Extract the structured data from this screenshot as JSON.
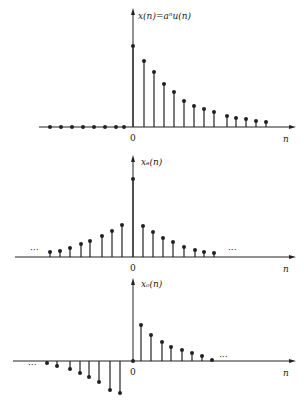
{
  "colors": {
    "ink": "#222222",
    "background": "#ffffff"
  },
  "chart_data": [
    {
      "type": "stem",
      "title": "x(n)=a^n u(n)",
      "ylabel": "x(n)=aⁿu(n)",
      "xlabel": "n",
      "origin_label": "0",
      "axis_y": 127,
      "origin_x": 133,
      "axis_left": 39,
      "axis_right": 296,
      "arrow_top": 8,
      "label_pos": {
        "x": 138,
        "y": 19
      },
      "n": [
        -8,
        -7,
        -6,
        -5,
        -4,
        -3,
        -2,
        -1,
        0,
        1,
        2,
        3,
        4,
        5,
        6,
        7,
        8,
        9,
        10,
        11,
        12,
        13
      ],
      "x_px": [
        50,
        61,
        72,
        83,
        94,
        105,
        116,
        124,
        133,
        144,
        154,
        164,
        174,
        184,
        194,
        204,
        214,
        227,
        236,
        246,
        256,
        266
      ],
      "y_px": [
        127,
        127,
        127,
        127,
        127,
        127,
        127,
        127,
        46,
        61,
        72,
        84,
        92,
        101,
        106,
        109,
        112,
        116,
        118,
        119,
        121,
        122
      ],
      "ellipsis": []
    },
    {
      "type": "stem",
      "title": "x_e(n)",
      "ylabel": "xₑ(n)",
      "xlabel": "n",
      "origin_label": "0",
      "axis_y": 257,
      "origin_x": 133,
      "axis_left": 15,
      "axis_right": 296,
      "arrow_top": 155,
      "label_pos": {
        "x": 141,
        "y": 165
      },
      "n": [
        -8,
        -7,
        -6,
        -5,
        -4,
        -3,
        -2,
        -1,
        0,
        1,
        2,
        3,
        4,
        5,
        6,
        7,
        8
      ],
      "x_px": [
        50,
        60,
        70,
        81,
        90,
        102,
        112,
        122,
        133,
        143,
        153,
        163,
        173,
        184,
        195,
        204,
        214
      ],
      "y_px": [
        252,
        251,
        248,
        244,
        241,
        236,
        231,
        225,
        179,
        226,
        232,
        238,
        242,
        247,
        250,
        252,
        253
      ],
      "ellipsis": [
        {
          "x": 30,
          "y": 253,
          "text": "···"
        },
        {
          "x": 228,
          "y": 253,
          "text": "···"
        }
      ]
    },
    {
      "type": "stem",
      "title": "x_o(n)",
      "ylabel": "xₒ(n)",
      "xlabel": "n",
      "origin_label": "0",
      "axis_y": 361,
      "origin_x": 133,
      "axis_left": 13,
      "axis_right": 296,
      "arrow_top": 278,
      "label_pos": {
        "x": 141,
        "y": 287
      },
      "n": [
        -8,
        -7,
        -6,
        -5,
        -4,
        -3,
        -2,
        -1,
        0,
        1,
        2,
        3,
        4,
        5,
        6,
        7,
        8
      ],
      "x_px": [
        47,
        57,
        70,
        80,
        89,
        99,
        110,
        120,
        133,
        141,
        151,
        162,
        171,
        182,
        192,
        202,
        212
      ],
      "y_px": [
        363,
        366,
        369,
        373,
        377,
        382,
        390,
        393,
        361,
        325,
        335,
        342,
        347,
        350,
        353,
        356,
        360
      ],
      "ellipsis": [
        {
          "x": 28,
          "y": 368,
          "text": "···"
        },
        {
          "x": 219,
          "y": 360,
          "text": "···"
        }
      ]
    }
  ]
}
